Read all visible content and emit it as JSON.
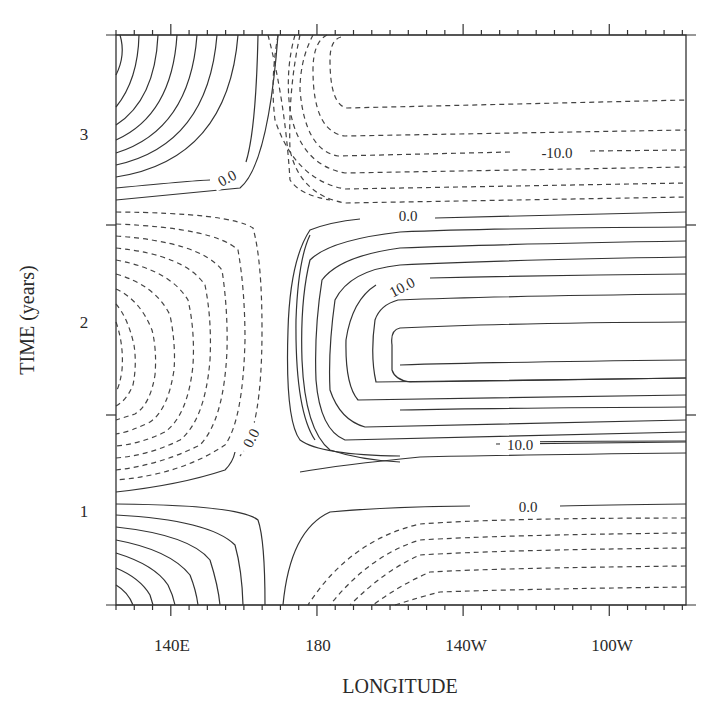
{
  "chart_data": {
    "type": "contour",
    "title": "",
    "xlabel": "LONGITUDE",
    "ylabel": "TIME (years)",
    "x_ticks": [
      {
        "label": "140E",
        "lon": 140
      },
      {
        "label": "180",
        "lon": 180
      },
      {
        "label": "140W",
        "lon": 220
      },
      {
        "label": "100W",
        "lon": 260
      }
    ],
    "y_ticks": [
      {
        "label": "1",
        "value": 1
      },
      {
        "label": "2",
        "value": 2
      },
      {
        "label": "3",
        "value": 3
      }
    ],
    "xlim": [
      125,
      281
    ],
    "ylim": [
      0.5,
      3.5
    ],
    "x_minor_tick_interval_deg": 5,
    "y_half_year_ticks": [
      1.5,
      2.5
    ],
    "contour_interval": 2.5,
    "negative_contours_dashed": true,
    "contour_labels": [
      {
        "text": "0.0",
        "lon": 142,
        "time": 2.68,
        "rotate": -28
      },
      {
        "text": "-10.0",
        "lon": 229,
        "time": 2.98,
        "rotate": 0
      },
      {
        "text": "0.0",
        "lon": 197,
        "time": 2.55,
        "rotate": 0
      },
      {
        "text": "10.0",
        "lon": 196,
        "time": 2.19,
        "rotate": -28
      },
      {
        "text": "0.0",
        "lon": 152,
        "time": 1.4,
        "rotate": -62
      },
      {
        "text": "10.0",
        "lon": 212,
        "time": 1.33,
        "rotate": 0
      },
      {
        "text": "0.0",
        "lon": 213,
        "time": 1.05,
        "rotate": 0
      }
    ],
    "features": [
      {
        "type": "max",
        "region": "east (170E-280E)",
        "time_center": 1.75,
        "peak_approx": 17.5
      },
      {
        "type": "min",
        "region": "east (170E-280E)",
        "time_center": 3.3,
        "peak_approx": -15
      },
      {
        "type": "min",
        "region": "east (170E-280E)",
        "time_center": 0.5,
        "peak_approx": -12.5
      },
      {
        "type": "min",
        "region": "west (125E-160E)",
        "time_center": 2.0,
        "peak_approx": -20
      },
      {
        "type": "max",
        "region": "west (125E-160E)",
        "time_center": 3.4,
        "peak_approx": 20
      },
      {
        "type": "max",
        "region": "west (125E-160E)",
        "time_center": 0.5,
        "peak_approx": 17.5
      }
    ]
  },
  "axes": {
    "x_title": "LONGITUDE",
    "y_title": "TIME (years)",
    "x_tick_labels": [
      "140E",
      "180",
      "140W",
      "100W"
    ],
    "y_tick_labels": [
      "3",
      "2",
      "1"
    ]
  },
  "contours": {
    "labels": [
      "0.0",
      "-10.0",
      "0.0",
      "10.0",
      "0.0",
      "10.0",
      "0.0"
    ]
  }
}
